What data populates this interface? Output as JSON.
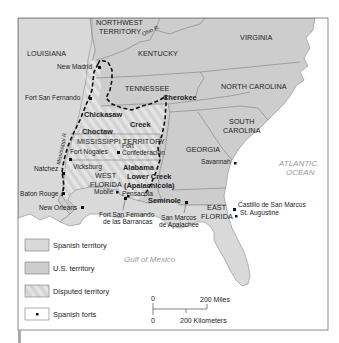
{
  "map": {
    "title": "",
    "colors": {
      "spanish_territory": "#d9d9d9",
      "us_territory": "#cdcdcd",
      "disputed_hatch_a": "#d4d4d4",
      "disputed_hatch_b": "#e6e6e6",
      "water": "#ffffff",
      "border": "#7a7a7a",
      "frame": "#6e6e6e",
      "dashed_line": "#111111",
      "fort_marker": "#111111"
    },
    "regions": {
      "louisiana": "LOUISIANA",
      "northwest_territory_1": "NORTHWEST",
      "northwest_territory_2": "TERRITORY",
      "kentucky": "KENTUCKY",
      "virginia": "VIRGINIA",
      "tennessee": "TENNESSEE",
      "north_carolina": "NORTH CAROLINA",
      "south_carolina_1": "SOUTH",
      "south_carolina_2": "CAROLINA",
      "georgia": "GEORGIA",
      "mississippi_territory": "MISSISSIPPI TERRITORY",
      "west_florida_1": "WEST",
      "west_florida_2": "FLORIDA",
      "east_florida_1": "EAST",
      "east_florida_2": "FLORIDA"
    },
    "tribes": {
      "chickasaw": "Chickasaw",
      "cherokee": "Cherokee",
      "creek": "Creek",
      "choctaw": "Choctaw",
      "alabama": "Alabama",
      "lower_creek_1": "Lower Creek",
      "lower_creek_2": "(Apalachicola)",
      "seminole": "Seminole"
    },
    "rivers": {
      "mississippi": "Mississippi R.",
      "ohio": "Ohio R."
    },
    "water_bodies": {
      "atlantic_1": "ATLANTIC",
      "atlantic_2": "OCEAN",
      "gulf": "Gulf of Mexico"
    },
    "places": {
      "new_madrid": "New Madrid",
      "fort_san_fernando": "Fort San Fernando",
      "fort_nogales": "Fort Nogales",
      "fort_confederacion_1": "Fort",
      "fort_confederacion_2": "Confederación",
      "natchez": "Natchez",
      "vicksburg": "Vicksburg",
      "baton_rouge": "Baton Rouge",
      "new_orleans": "New Orleans",
      "mobile": "Mobile",
      "pensacola": "Pensacola",
      "fort_barrancas_1": "Fort San Fernando",
      "fort_barrancas_2": "de las Barrancas",
      "san_marcos_1": "San Marcos",
      "san_marcos_2": "de Apalachee",
      "savannah": "Savannah",
      "castillo_1": "Castillo de San Marcos",
      "castillo_2": "St. Augustine"
    },
    "legend": [
      {
        "label": "Spanish territory",
        "swatch": "spanish"
      },
      {
        "label": "U.S. territory",
        "swatch": "us"
      },
      {
        "label": "Disputed territory",
        "swatch": "disputed"
      },
      {
        "label": "Spanish forts",
        "swatch": "fort"
      }
    ],
    "scale": {
      "zero_top": "0",
      "miles": "200 Miles",
      "zero_bottom": "0",
      "kilometers": "200 Kilometers"
    }
  }
}
